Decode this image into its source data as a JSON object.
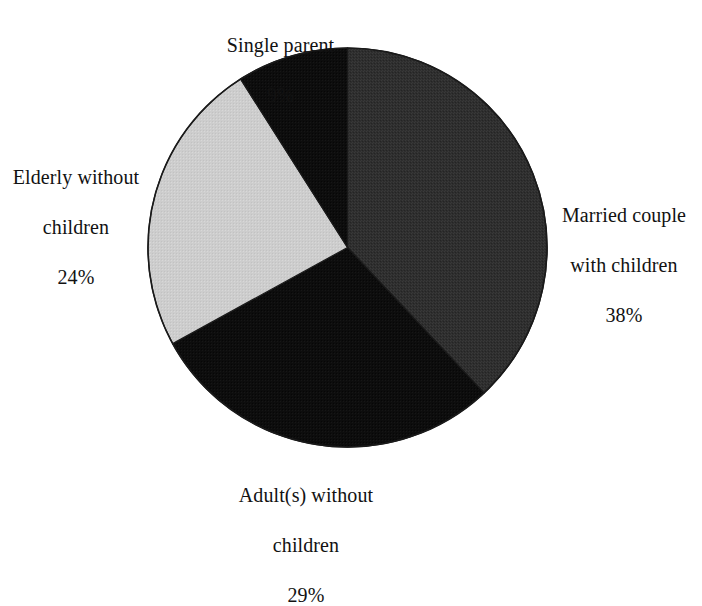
{
  "figure": {
    "background_color": "#ffffff",
    "text_color": "#121212",
    "outline_color": "#1a1a1a"
  },
  "chart_data": {
    "type": "pie",
    "title": "",
    "subtitle": "",
    "xlabel": "",
    "ylabel": "",
    "legend_position": "none",
    "grid": false,
    "start_angle_deg": 0,
    "direction": "clockwise",
    "units": "percent",
    "total": 100,
    "categories": [
      "Married couple with children",
      "Adult(s) without children",
      "Elderly without children",
      "Single parent"
    ],
    "values": [
      38,
      29,
      24,
      9
    ],
    "slices": [
      {
        "id": "married-with-children",
        "label_line1": "Married couple",
        "label_line2": "with children",
        "percent_text": "38%",
        "value": 38,
        "color": "#2e2e2e",
        "label_position": "right"
      },
      {
        "id": "adults-without-children",
        "label_line1": "Adult(s) without",
        "label_line2": "children",
        "percent_text": "29%",
        "value": 29,
        "color": "#0d0d0d",
        "label_position": "bottom"
      },
      {
        "id": "elderly-without-children",
        "label_line1": "Elderly without",
        "label_line2": "children",
        "percent_text": "24%",
        "value": 24,
        "color": "#cdcdcd",
        "label_position": "left"
      },
      {
        "id": "single-parent",
        "label_line1": "Single parent",
        "label_line2": "",
        "percent_text": "9%",
        "value": 9,
        "color": "#0d0d0d",
        "label_position": "top"
      }
    ]
  }
}
